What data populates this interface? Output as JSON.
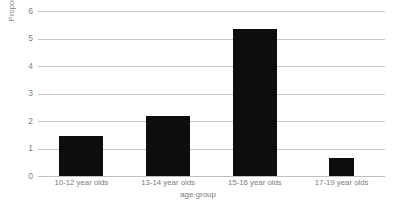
{
  "chart_data": {
    "type": "bar",
    "title": "",
    "categories": [
      "10-12 year olds",
      "13-14 year olds",
      "15-16 year olds",
      "17-19 year olds"
    ],
    "values": [
      1.45,
      2.2,
      5.35,
      0.65
    ],
    "xlabel": "age group",
    "ylabel": "Proportion of use of 'like'",
    "ylim": [
      0,
      6
    ],
    "yticks": [
      "0",
      "1",
      "2",
      "3",
      "4",
      "5",
      "6"
    ],
    "ytick_values": [
      0,
      1,
      2,
      3,
      4,
      5,
      6
    ],
    "grid": "horizontal",
    "legend": "none",
    "bar_color": "#0d0d0d",
    "gridline_color": "#c8c8c8",
    "text_color": "#7d7d7d"
  }
}
